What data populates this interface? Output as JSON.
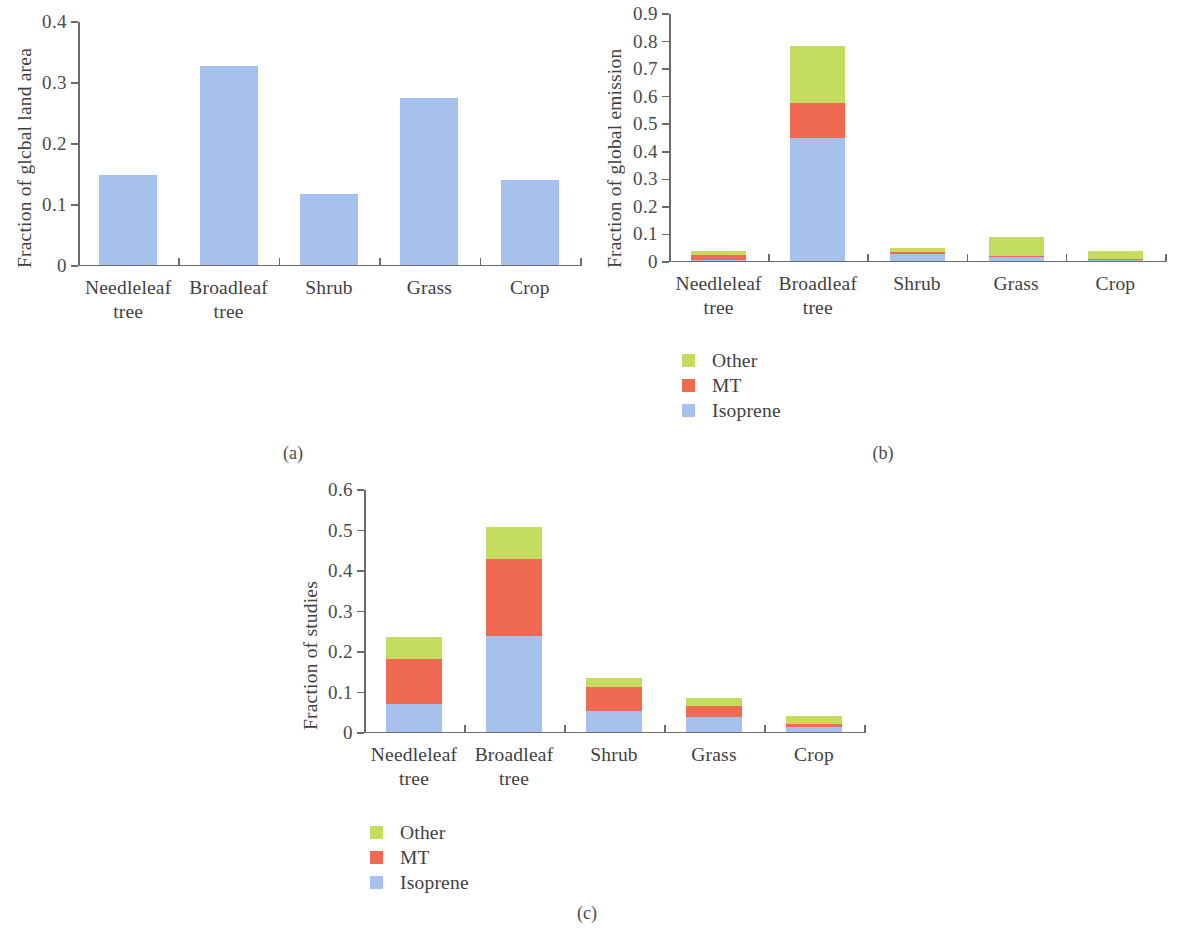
{
  "figure": {
    "captions": {
      "a": "(a)",
      "b": "(b)",
      "c": "(c)"
    }
  },
  "legend": {
    "items": [
      {
        "label": "Other",
        "color": "#c5dd5e"
      },
      {
        "label": "MT",
        "color": "#ee6a50"
      },
      {
        "label": "Isoprene",
        "color": "#a6c1ed"
      }
    ]
  },
  "colors": {
    "other": "#c5dd5e",
    "mt": "#ee6a50",
    "isoprene": "#a6c1ed",
    "single_bar": "#a6c1ed",
    "axis": "#6b6b6b",
    "text": "#3f3f3f"
  },
  "chart_data": [
    {
      "id": "panel-a",
      "type": "bar",
      "title": "",
      "xlabel": "",
      "ylabel": "Fraction of glcbal land area",
      "categories": [
        "Needleleaf tree",
        "Broadleaf tree",
        "Shrub",
        "Grass",
        "Crop"
      ],
      "category_lines": [
        [
          "Needleleaf",
          "tree"
        ],
        [
          "Broadleaf",
          "tree"
        ],
        [
          "Shrub"
        ],
        [
          "Grass"
        ],
        [
          "Crop"
        ]
      ],
      "values": [
        0.146,
        0.325,
        0.115,
        0.273,
        0.138
      ],
      "ylim": [
        0,
        0.4
      ],
      "yticks": [
        0,
        0.1,
        0.2,
        0.3,
        0.4
      ],
      "ytick_labels": [
        "0",
        "0.1",
        "0.2",
        "0.3",
        "0.4"
      ],
      "grid": false,
      "legend_position": "none",
      "series_color": "#a6c1ed"
    },
    {
      "id": "panel-b",
      "type": "bar",
      "stacked": true,
      "title": "",
      "xlabel": "",
      "ylabel": "Fraction of global emission",
      "categories": [
        "Needleleaf tree",
        "Broadleaf tree",
        "Shrub",
        "Grass",
        "Crop"
      ],
      "category_lines": [
        [
          "Needleleaf",
          "tree"
        ],
        [
          "Broadleaf",
          "tree"
        ],
        [
          "Shrub"
        ],
        [
          "Grass"
        ],
        [
          "Crop"
        ]
      ],
      "series": [
        {
          "name": "Isoprene",
          "color": "#a6c1ed",
          "values": [
            0.002,
            0.445,
            0.022,
            0.013,
            0.002
          ]
        },
        {
          "name": "MT",
          "color": "#ee6a50",
          "values": [
            0.017,
            0.128,
            0.009,
            0.002,
            0.002
          ]
        },
        {
          "name": "Other",
          "color": "#c5dd5e",
          "values": [
            0.014,
            0.205,
            0.016,
            0.072,
            0.029
          ]
        }
      ],
      "totals": [
        0.033,
        0.778,
        0.047,
        0.087,
        0.033
      ],
      "ylim": [
        0,
        0.9
      ],
      "yticks": [
        0,
        0.1,
        0.2,
        0.3,
        0.4,
        0.5,
        0.6,
        0.7,
        0.8,
        0.9
      ],
      "ytick_labels": [
        "0",
        "0.1",
        "0.2",
        "0.3",
        "0.4",
        "0.5",
        "0.6",
        "0.7",
        "0.8",
        "0.9"
      ],
      "grid": false,
      "legend_position": "below-left"
    },
    {
      "id": "panel-c",
      "type": "bar",
      "stacked": true,
      "title": "",
      "xlabel": "",
      "ylabel": "Fraction of studies",
      "categories": [
        "Needleleaf tree",
        "Broadleaf tree",
        "Shrub",
        "Grass",
        "Crop"
      ],
      "category_lines": [
        [
          "Needleleaf",
          "tree"
        ],
        [
          "Broadleaf",
          "tree"
        ],
        [
          "Shrub"
        ],
        [
          "Grass"
        ],
        [
          "Crop"
        ]
      ],
      "series": [
        {
          "name": "Isoprene",
          "color": "#a6c1ed",
          "values": [
            0.068,
            0.236,
            0.05,
            0.035,
            0.01
          ]
        },
        {
          "name": "MT",
          "color": "#ee6a50",
          "values": [
            0.11,
            0.189,
            0.06,
            0.027,
            0.009
          ]
        },
        {
          "name": "Other",
          "color": "#c5dd5e",
          "values": [
            0.056,
            0.08,
            0.022,
            0.02,
            0.02
          ]
        }
      ],
      "totals": [
        0.234,
        0.505,
        0.132,
        0.082,
        0.039
      ],
      "ylim": [
        0,
        0.6
      ],
      "yticks": [
        0,
        0.1,
        0.2,
        0.3,
        0.4,
        0.5,
        0.6
      ],
      "ytick_labels": [
        "0",
        "0.1",
        "0.2",
        "0.3",
        "0.4",
        "0.5",
        "0.6"
      ],
      "grid": false,
      "legend_position": "below-left"
    }
  ]
}
